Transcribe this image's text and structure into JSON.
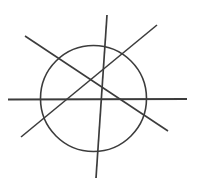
{
  "figure": {
    "width": 199,
    "height": 193,
    "background_color": "#ffffff",
    "stroke_color": "#3c3c3c",
    "stroke_width": 1.6,
    "shapes": [
      {
        "name": "circle",
        "type": "circle",
        "cx": 93.5,
        "cy": 98.5,
        "r": 53,
        "stroke_color": "#3c3c3c",
        "stroke_width": 1.6,
        "fill": "none"
      },
      {
        "name": "horizontal-line",
        "type": "line",
        "x1": 8,
        "y1": 99.5,
        "x2": 187,
        "y2": 99,
        "stroke_color": "#3c3c3c",
        "stroke_width": 1.8
      },
      {
        "name": "vertical-line",
        "type": "line",
        "x1": 107,
        "y1": 15,
        "x2": 96,
        "y2": 178,
        "stroke_color": "#3c3c3c",
        "stroke_width": 1.7
      },
      {
        "name": "diagonal-line-down-right",
        "type": "line",
        "x1": 25,
        "y1": 36,
        "x2": 168,
        "y2": 131,
        "stroke_color": "#3c3c3c",
        "stroke_width": 1.6
      },
      {
        "name": "diagonal-line-up-right",
        "type": "line",
        "x1": 21,
        "y1": 137,
        "x2": 157,
        "y2": 25,
        "stroke_color": "#3c3c3c",
        "stroke_width": 1.6
      }
    ]
  }
}
